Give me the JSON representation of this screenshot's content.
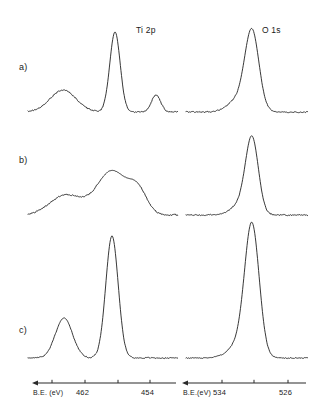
{
  "figure": {
    "background_color": "#ffffff",
    "trace_color": "#141414",
    "axis_color": "#2a2a2a"
  },
  "panels": [
    {
      "id": "a",
      "label": "a)"
    },
    {
      "id": "b",
      "label": "b)"
    },
    {
      "id": "c",
      "label": "c)"
    }
  ],
  "region_labels": [
    {
      "name": "ti-2p-label",
      "text": "Ti 2p"
    },
    {
      "name": "o-1s-label",
      "text": "O 1s"
    }
  ],
  "axes": [
    {
      "name": "ti-2p-axis",
      "caption": "B.E. (eV)",
      "ticks": [
        {
          "value": "",
          "x": 52
        },
        {
          "value": "462",
          "x": 85
        },
        {
          "value": "",
          "x": 118
        },
        {
          "value": "454",
          "x": 150
        }
      ],
      "x_start": 32,
      "x_end": 176,
      "y": 383,
      "direction": "decreasing"
    },
    {
      "name": "o-1s-axis",
      "caption": "B.E.(eV)",
      "ticks": [
        {
          "value": "534",
          "x": 222
        },
        {
          "value": "",
          "x": 254
        },
        {
          "value": "526",
          "x": 288
        }
      ],
      "x_start": 182,
      "x_end": 306,
      "y": 383,
      "direction": "decreasing"
    }
  ],
  "chart_data": {
    "type": "line",
    "xlabel": "B.E. (eV)",
    "ylabel": "Intensity (a.u.)",
    "grid": false,
    "legend": false,
    "panels": [
      {
        "panel": "a",
        "series": [
          {
            "name": "Ti 2p - sample a",
            "region": "Ti 2p",
            "xlabel": "B.E. (eV)",
            "xlim": [
              466,
              452
            ],
            "baseline_y": 112,
            "noise": 1.1,
            "peaks": [
              {
                "label": "satellite",
                "center_x": 63,
                "height": 22,
                "width": 13,
                "shape": "gauss"
              },
              {
                "label": "Ti 2p3/2",
                "center_x": 115,
                "height": 80,
                "width": 5.2,
                "shape": "gauss"
              },
              {
                "label": "Ti 2p1/2",
                "center_x": 156,
                "height": 17,
                "width": 4.6,
                "shape": "gauss"
              }
            ],
            "x_start": 28,
            "x_end": 178
          },
          {
            "name": "O 1s - sample a",
            "region": "O 1s",
            "xlabel": "B.E. (eV)",
            "xlim": [
              538,
              524
            ],
            "baseline_y": 112,
            "noise": 1.0,
            "peaks": [
              {
                "label": "O 1s",
                "center_x": 252,
                "height": 79,
                "width": 7.0,
                "shape": "gauss"
              },
              {
                "label": "shoulder",
                "center_x": 238,
                "height": 12,
                "width": 10,
                "shape": "gauss"
              }
            ],
            "x_start": 186,
            "x_end": 308
          }
        ]
      },
      {
        "panel": "b",
        "series": [
          {
            "name": "Ti 2p - sample b",
            "region": "Ti 2p",
            "xlabel": "B.E. (eV)",
            "xlim": [
              466,
              452
            ],
            "baseline_y": 215,
            "noise": 1.2,
            "peaks": [
              {
                "label": "broad low-BE band",
                "center_x": 66,
                "height": 20,
                "width": 16,
                "shape": "gauss"
              },
              {
                "label": "main broad band",
                "center_x": 112,
                "height": 44,
                "width": 15,
                "shape": "gauss"
              },
              {
                "label": "shoulder",
                "center_x": 138,
                "height": 22,
                "width": 9,
                "shape": "gauss"
              }
            ],
            "x_start": 28,
            "x_end": 178
          },
          {
            "name": "O 1s - sample b",
            "region": "O 1s",
            "xlabel": "B.E. (eV)",
            "xlim": [
              538,
              524
            ],
            "baseline_y": 215,
            "noise": 1.0,
            "peaks": [
              {
                "label": "O 1s",
                "center_x": 252,
                "height": 75,
                "width": 6.4,
                "shape": "gauss"
              },
              {
                "label": "shoulder",
                "center_x": 240,
                "height": 10,
                "width": 9,
                "shape": "gauss"
              }
            ],
            "x_start": 186,
            "x_end": 308
          }
        ]
      },
      {
        "panel": "c",
        "series": [
          {
            "name": "Ti 2p - sample c",
            "region": "Ti 2p",
            "xlabel": "B.E. (eV)",
            "xlim": [
              466,
              452
            ],
            "baseline_y": 358,
            "noise": 1.0,
            "peaks": [
              {
                "label": "Ti 2p1/2",
                "center_x": 64,
                "height": 40,
                "width": 8.5,
                "shape": "gauss"
              },
              {
                "label": "Ti 2p3/2",
                "center_x": 112,
                "height": 122,
                "width": 6.2,
                "shape": "gauss"
              }
            ],
            "x_start": 28,
            "x_end": 178
          },
          {
            "name": "O 1s - sample c",
            "region": "O 1s",
            "xlabel": "B.E. (eV)",
            "xlim": [
              538,
              524
            ],
            "baseline_y": 358,
            "noise": 0.8,
            "peaks": [
              {
                "label": "O 1s",
                "center_x": 252,
                "height": 128,
                "width": 7.2,
                "shape": "gauss"
              },
              {
                "label": "shoulder",
                "center_x": 240,
                "height": 14,
                "width": 11,
                "shape": "gauss"
              }
            ],
            "x_start": 186,
            "x_end": 308
          }
        ]
      }
    ]
  }
}
